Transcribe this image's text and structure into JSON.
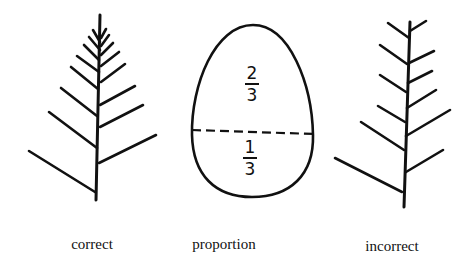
{
  "figures": {
    "correct": {
      "label": "correct",
      "icon": "fir-branch-correct-icon",
      "trunk": {
        "x1": 100,
        "y1": 15,
        "x2": 96,
        "y2": 200
      },
      "branches": [
        [
          29,
          151,
          95,
          192
        ],
        [
          49,
          112,
          97,
          148
        ],
        [
          61,
          88,
          97,
          116
        ],
        [
          71,
          67,
          98,
          89
        ],
        [
          77,
          56,
          99,
          72
        ],
        [
          84,
          45,
          99,
          60
        ],
        [
          89,
          37,
          100,
          50
        ],
        [
          93,
          30,
          100,
          42
        ],
        [
          156,
          135,
          99,
          163
        ],
        [
          143,
          105,
          100,
          127
        ],
        [
          135,
          86,
          100,
          105
        ],
        [
          125,
          64,
          101,
          82
        ],
        [
          119,
          52,
          101,
          66
        ],
        [
          113,
          43,
          101,
          55
        ],
        [
          109,
          35,
          101,
          46
        ],
        [
          106,
          29,
          101,
          38
        ]
      ]
    },
    "proportion": {
      "label": "proportion",
      "icon": "egg-proportion-icon",
      "top_fraction": {
        "numerator": "2",
        "denominator": "3"
      },
      "bottom_fraction": {
        "numerator": "1",
        "denominator": "3"
      },
      "divider": {
        "x1": 192,
        "y1": 130,
        "x2": 314,
        "y2": 134
      }
    },
    "incorrect": {
      "label": "incorrect",
      "icon": "fir-branch-incorrect-icon",
      "trunk": {
        "x1": 410,
        "y1": 22,
        "x2": 404,
        "y2": 207
      },
      "branches": [
        [
          335,
          158,
          402,
          192
        ],
        [
          361,
          122,
          404,
          150
        ],
        [
          378,
          106,
          405,
          122
        ],
        [
          380,
          75,
          406,
          92
        ],
        [
          380,
          45,
          407,
          64
        ],
        [
          388,
          23,
          409,
          38
        ],
        [
          426,
          21,
          410,
          31
        ],
        [
          434,
          51,
          409,
          63
        ],
        [
          432,
          71,
          408,
          83
        ],
        [
          436,
          90,
          407,
          108
        ],
        [
          450,
          110,
          406,
          136
        ],
        [
          443,
          150,
          406,
          172
        ]
      ]
    }
  }
}
